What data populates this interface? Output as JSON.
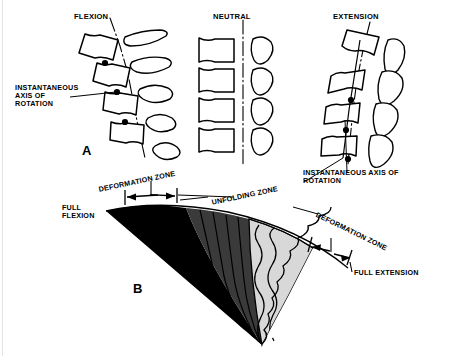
{
  "figure": {
    "background_color": "#ffffff",
    "ink_color": "#000000"
  },
  "panel_a": {
    "letter": "A",
    "columns": [
      {
        "key": "flexion",
        "heading": "FLEXION",
        "vertebra_count": 4,
        "axis_dot_count": 3
      },
      {
        "key": "neutral",
        "heading": "NEUTRAL",
        "vertebra_count": 4,
        "axis_dot_count": 0
      },
      {
        "key": "extension",
        "heading": "EXTENSION",
        "vertebra_count": 4,
        "axis_dot_count": 3
      }
    ],
    "callout_left": {
      "lines": [
        "INSTANTANEOUS",
        "AXIS OF",
        "ROTATION"
      ]
    },
    "callout_right": {
      "lines": [
        "INSTANTANEOUS AXIS OF",
        "ROTATION"
      ]
    }
  },
  "panel_b": {
    "letter": "B",
    "labels": {
      "full_flexion": [
        "FULL",
        "FLEXION"
      ],
      "deformation_zone_left": "DEFORMATION ZONE",
      "unfolding_zone": "UNFOLDING ZONE",
      "deformation_zone_right": "DEFORMATION ZONE",
      "full_extension": "FULL EXTENSION"
    },
    "zone_fills": {
      "deformation_left": "#000000",
      "unfolding_dark": "#3a3a3a",
      "unfolding_light": "#d8d8d8",
      "deformation_right": "#ffffff"
    }
  }
}
